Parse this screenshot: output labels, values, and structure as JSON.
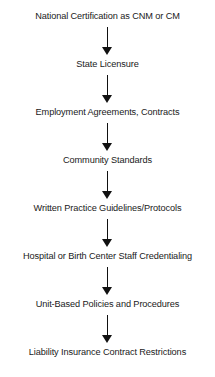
{
  "diagram": {
    "type": "vertical-flowchart",
    "steps": [
      {
        "label": "National Certification as CNM or CM"
      },
      {
        "label": "State Licensure"
      },
      {
        "label": "Employment Agreements, Contracts"
      },
      {
        "label": "Community Standards"
      },
      {
        "label": "Written Practice Guidelines/Protocols"
      },
      {
        "label": "Hospital or Birth Center Staff Credentialing"
      },
      {
        "label": "Unit-Based Policies and Procedures"
      },
      {
        "label": "Liability Insurance Contract Restrictions"
      }
    ],
    "connector": "down-arrow",
    "colors": {
      "text": "#1a1a1a",
      "arrow": "#111111",
      "background": "#ffffff"
    }
  }
}
